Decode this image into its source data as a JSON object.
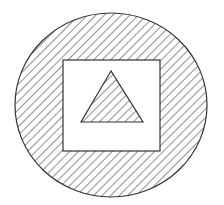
{
  "diagram": {
    "canvas": {
      "width": 224,
      "height": 205,
      "background": "#ffffff"
    },
    "stroke_color": "#333333",
    "hatch": {
      "direction": "diagonal-up-right",
      "spacing": 6,
      "color": "#333333"
    },
    "shapes": [
      {
        "type": "circle",
        "name": "outer-circle",
        "cx": 111,
        "cy": 105,
        "rx": 96,
        "ry": 92,
        "fill": "hatched"
      },
      {
        "type": "square",
        "name": "inner-square",
        "x": 63,
        "y": 60,
        "width": 97,
        "height": 91,
        "fill": "#ffffff"
      },
      {
        "type": "triangle",
        "name": "inner-triangle",
        "points": [
          [
            111,
            71
          ],
          [
            81,
            122
          ],
          [
            143,
            122
          ]
        ],
        "fill": "hatched"
      }
    ]
  }
}
